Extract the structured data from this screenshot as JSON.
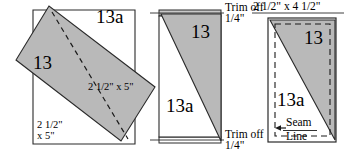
{
  "figure": {
    "type": "quilting-piecing-diagram",
    "panel_count": 3,
    "fill_color": "#b9b9b9",
    "line_color": "#1a1a1a",
    "background": "#ffffff"
  },
  "panels": {
    "left": {
      "name": "layered-pieces-panel",
      "piece_gray_label": "13",
      "piece_white_label": "13a",
      "dim_white": "2 1/2\"\nx 5\"",
      "dim_gray": "2 1/2\" x 5\"",
      "has_dashed_stitch_line": true
    },
    "middle": {
      "name": "trimmed-unit-panel",
      "piece_gray_label": "13",
      "piece_white_label": "13a",
      "trim_top_line1": "Trim off",
      "trim_top_line2": "1/4\"",
      "trim_bottom_line1": "Trim off",
      "trim_bottom_line2": "1/4\""
    },
    "right": {
      "name": "finished-unit-panel",
      "size_label": "2 1/2\" x 4 1/2\"",
      "piece_gray_label": "13",
      "piece_white_label": "13a",
      "seam_line_l1": "Seam",
      "seam_line_l2": "Line",
      "has_dashed_seam_box": true
    }
  }
}
